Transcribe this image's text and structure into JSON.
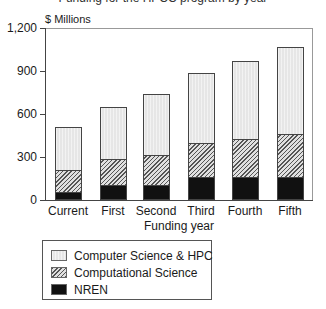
{
  "chart_data": {
    "type": "bar",
    "stacked": true,
    "title": "Funding for the HPCC program by year",
    "xlabel": "Funding year",
    "ylabel": "$ Millions",
    "ylim": [
      0,
      1200
    ],
    "yticks": [
      0,
      300,
      600,
      900,
      1200
    ],
    "ytick_labels": [
      "0",
      "300",
      "600",
      "900",
      "1,200"
    ],
    "categories": [
      "Current",
      "First",
      "Second",
      "Third",
      "Fourth",
      "Fifth"
    ],
    "series": [
      {
        "name": "NREN",
        "values": [
          50,
          100,
          100,
          150,
          150,
          150
        ]
      },
      {
        "name": "Computational Science",
        "values": [
          150,
          180,
          210,
          240,
          270,
          300
        ]
      },
      {
        "name": "Computer Science & HPC",
        "values": [
          300,
          360,
          420,
          490,
          540,
          610
        ]
      }
    ],
    "totals": [
      500,
      640,
      730,
      880,
      960,
      1060
    ],
    "legend_position": "below",
    "grid": false
  },
  "labels": {
    "title": "Funding for the HPCC program by year",
    "y_unit": "$ Millions",
    "x_title": "Funding year",
    "legend": [
      "Computer Science & HPC",
      "Computational Science",
      "NREN"
    ]
  }
}
